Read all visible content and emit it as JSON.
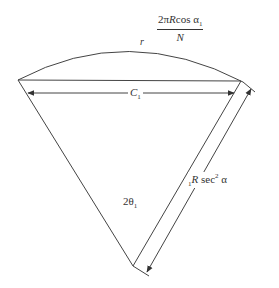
{
  "diagram": {
    "arc_label": "r",
    "arc_length_formula": {
      "numerator_prefix": "2π",
      "numerator_R": "R",
      "numerator_cos": "cos α",
      "numerator_sub": "1",
      "denominator": "N"
    },
    "chord_label": {
      "text": "C",
      "sub": "1"
    },
    "angle_label": {
      "text": "2θ",
      "sub": "1"
    },
    "radius_label": {
      "pre_sub": "1",
      "R": "R",
      "sec": " sec",
      "sup": "2",
      "alpha": " α"
    },
    "colors": {
      "line": "#444444",
      "text": "#333333",
      "background": "#ffffff"
    }
  }
}
